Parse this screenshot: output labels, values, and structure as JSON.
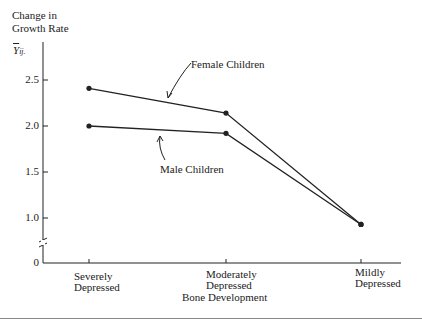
{
  "chart_data": {
    "type": "line",
    "title": "",
    "ylabel": "Change in Growth Rate",
    "ylabel_line1": "Change in",
    "ylabel_line2": "Growth Rate",
    "y_symbol": "Ȳij.",
    "xlabel": "Bone Development",
    "categories": [
      "Severely Depressed",
      "Moderately Depressed",
      "Mildly Depressed"
    ],
    "category_lines": [
      [
        "Severely",
        "Depressed"
      ],
      [
        "Moderately",
        "Depressed"
      ],
      [
        "Mildly",
        "Depressed"
      ]
    ],
    "y_ticks": [
      "0",
      "1.0",
      "1.5",
      "2.0",
      "2.5"
    ],
    "y_tick_values": [
      0,
      1.0,
      1.5,
      2.0,
      2.5
    ],
    "ylim": [
      0,
      2.7
    ],
    "axis_break": true,
    "grid": false,
    "series": [
      {
        "name": "Female Children",
        "values": [
          2.41,
          2.14,
          0.93
        ]
      },
      {
        "name": "Male Children",
        "values": [
          2.0,
          1.92,
          0.93
        ]
      }
    ],
    "annotations": [
      "Female Children",
      "Male Children"
    ]
  }
}
